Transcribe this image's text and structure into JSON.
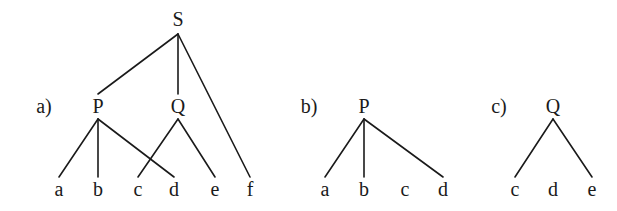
{
  "diagram": {
    "type": "tree-diagrams",
    "colors": {
      "ink": "#1a1a1a",
      "background": "#ffffff"
    },
    "panels": [
      {
        "id": "a",
        "label": "a)",
        "root": "S",
        "nodes": [
          {
            "id": "S",
            "label": "S",
            "x": 178,
            "y": 26
          },
          {
            "id": "P",
            "label": "P",
            "x": 98,
            "y": 113
          },
          {
            "id": "Q",
            "label": "Q",
            "x": 178,
            "y": 113
          },
          {
            "id": "a",
            "label": "a",
            "x": 59,
            "y": 196
          },
          {
            "id": "b",
            "label": "b",
            "x": 98,
            "y": 196
          },
          {
            "id": "c",
            "label": "c",
            "x": 138,
            "y": 196
          },
          {
            "id": "d",
            "label": "d",
            "x": 174,
            "y": 196
          },
          {
            "id": "e",
            "label": "e",
            "x": 215,
            "y": 196
          },
          {
            "id": "f",
            "label": "f",
            "x": 250,
            "y": 196
          }
        ],
        "edges": [
          [
            "S",
            "P"
          ],
          [
            "S",
            "Q"
          ],
          [
            "S",
            "f"
          ],
          [
            "P",
            "a"
          ],
          [
            "P",
            "b"
          ],
          [
            "P",
            "d"
          ],
          [
            "Q",
            "c"
          ],
          [
            "Q",
            "e"
          ]
        ]
      },
      {
        "id": "b",
        "label": "b)",
        "root": "P",
        "nodes": [
          {
            "id": "P",
            "label": "P",
            "x": 364,
            "y": 113
          },
          {
            "id": "a",
            "label": "a",
            "x": 325,
            "y": 196
          },
          {
            "id": "b",
            "label": "b",
            "x": 364,
            "y": 196
          },
          {
            "id": "c",
            "label": "c",
            "x": 405,
            "y": 196
          },
          {
            "id": "d",
            "label": "d",
            "x": 443,
            "y": 196
          }
        ],
        "edges": [
          [
            "P",
            "a"
          ],
          [
            "P",
            "b"
          ],
          [
            "P",
            "d"
          ]
        ]
      },
      {
        "id": "c",
        "label": "c)",
        "root": "Q",
        "nodes": [
          {
            "id": "Q",
            "label": "Q",
            "x": 553,
            "y": 113
          },
          {
            "id": "c",
            "label": "c",
            "x": 515,
            "y": 196
          },
          {
            "id": "d",
            "label": "d",
            "x": 553,
            "y": 196
          },
          {
            "id": "e",
            "label": "e",
            "x": 592,
            "y": 196
          }
        ],
        "edges": [
          [
            "Q",
            "c"
          ],
          [
            "Q",
            "e"
          ]
        ]
      }
    ],
    "panel_labels": [
      {
        "text": "a)",
        "x": 44,
        "y": 113
      },
      {
        "text": "b)",
        "x": 309,
        "y": 113
      },
      {
        "text": "c)",
        "x": 499,
        "y": 113
      }
    ]
  }
}
